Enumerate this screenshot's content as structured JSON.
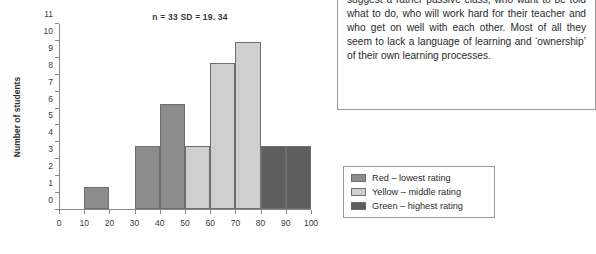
{
  "chart_data": {
    "type": "bar",
    "title": "n = 33 SD = 19. 34",
    "xlabel": "",
    "ylabel": "Number of students",
    "ylim": [
      0,
      11
    ],
    "xlim": [
      0,
      100
    ],
    "grid": false,
    "y_ticks": [
      0,
      1,
      2,
      3,
      4,
      5,
      6,
      7,
      8,
      9,
      10,
      11
    ],
    "x_ticks": [
      0,
      10,
      20,
      30,
      40,
      50,
      60,
      70,
      80,
      90,
      100
    ],
    "bins": [
      {
        "from": 0,
        "to": 10,
        "value": 0,
        "color_group": "none"
      },
      {
        "from": 10,
        "to": 20,
        "value": 1.3,
        "color_group": "red"
      },
      {
        "from": 20,
        "to": 30,
        "value": 0,
        "color_group": "none"
      },
      {
        "from": 30,
        "to": 40,
        "value": 3.75,
        "color_group": "red"
      },
      {
        "from": 40,
        "to": 50,
        "value": 6.2,
        "color_group": "red"
      },
      {
        "from": 50,
        "to": 60,
        "value": 3.7,
        "color_group": "yellow"
      },
      {
        "from": 60,
        "to": 70,
        "value": 8.65,
        "color_group": "yellow"
      },
      {
        "from": 70,
        "to": 80,
        "value": 9.9,
        "color_group": "yellow"
      },
      {
        "from": 80,
        "to": 90,
        "value": 3.7,
        "color_group": "green"
      },
      {
        "from": 90,
        "to": 100,
        "value": 3.7,
        "color_group": "green"
      }
    ],
    "legend": {
      "position": "right",
      "entries": [
        {
          "label": "Red – lowest rating",
          "color_group": "red",
          "color": "#8c8c8c"
        },
        {
          "label": "Yellow – middle rating",
          "color_group": "yellow",
          "color": "#cfcfcf"
        },
        {
          "label": "Green – highest rating",
          "color_group": "green",
          "color": "#5e5e5e"
        }
      ]
    }
  },
  "text_box": {
    "body": "suggest a rather passive class, who want to be told what to do, who will work hard for their teacher and who get on well with each other. Most of all they seem to lack a language of learning and ‘ownership’ of their own learning processes."
  },
  "bottom_caption": {
    "text": ""
  }
}
